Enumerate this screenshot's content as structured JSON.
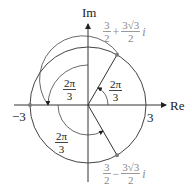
{
  "diagram": {
    "axes": {
      "x_label": "Re",
      "y_label": "Im"
    },
    "ticks": {
      "neg": "−3",
      "pos": "3"
    },
    "angles": [
      {
        "num": "2π",
        "den": "3",
        "position": "first"
      },
      {
        "num": "2π",
        "den": "3",
        "position": "second"
      },
      {
        "num": "2π",
        "den": "3",
        "position": "third"
      }
    ],
    "points": [
      {
        "label_real_num": "3",
        "label_real_den": "2",
        "op": "+",
        "label_imag_num": "3√3",
        "label_imag_den": "2",
        "unit": "i"
      },
      {
        "label_real_num": "3",
        "label_real_den": "2",
        "op": "−",
        "label_imag_num": "3√3",
        "label_imag_den": "2",
        "unit": "i"
      }
    ],
    "colors": {
      "line": "#333333",
      "point": "#7a7a7a",
      "label_gray": "#8a8a8a"
    }
  }
}
